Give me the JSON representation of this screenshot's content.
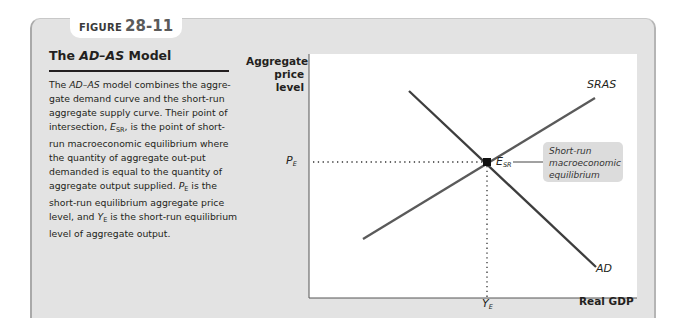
{
  "figure": {
    "label_word": "FIGURE",
    "label_number": "28-11"
  },
  "panel": {
    "title_prefix": "The ",
    "title_italic": "AD–AS",
    "title_suffix": " Model",
    "body": [
      {
        "t": "The "
      },
      {
        "t": "AD–AS",
        "i": true
      },
      {
        "t": " model combines the aggre-gate demand curve and the short-run aggregate supply curve. Their point of intersection, "
      },
      {
        "t": "E",
        "i": true
      },
      {
        "t": "SR",
        "sub": true
      },
      {
        "t": ", is the point of short-run macroeconomic equilibrium where the quantity of aggregate out-put demanded is equal to the quantity of aggregate output supplied. "
      },
      {
        "t": "P",
        "i": true
      },
      {
        "t": "E",
        "sub": true
      },
      {
        "t": " is the short-run equilibrium aggregate price level, and "
      },
      {
        "t": "Y",
        "i": true
      },
      {
        "t": "E",
        "sub": true
      },
      {
        "t": " is the short-run equilibrium level of aggregate output."
      }
    ]
  },
  "chart_data": {
    "type": "line",
    "title": "The AD–AS Model",
    "xlabel": "Real GDP",
    "ylabel": "Aggregate price level",
    "ylabel_lines": [
      "Aggregate",
      "price",
      "level"
    ],
    "grid": false,
    "series": [
      {
        "name": "AD",
        "description": "Aggregate demand, downward sloping",
        "points": [
          [
            0.31,
            0.84
          ],
          [
            0.88,
            0.13
          ]
        ]
      },
      {
        "name": "SRAS",
        "description": "Short-run aggregate supply, upward sloping",
        "points": [
          [
            0.17,
            0.24
          ],
          [
            0.88,
            0.81
          ]
        ]
      }
    ],
    "equilibrium": {
      "label": "E_SR",
      "x_label": "Y_E",
      "y_label": "P_E",
      "x": 0.54,
      "y": 0.56
    },
    "annotations": [
      {
        "text": "Short-run macroeconomic equilibrium",
        "target": "E_SR"
      },
      {
        "text": "SRAS",
        "target": "SRAS"
      },
      {
        "text": "AD",
        "target": "AD"
      }
    ],
    "ticks": {
      "x": [
        "Y_E"
      ],
      "y": [
        "P_E"
      ]
    }
  },
  "labels": {
    "pe_main": "P",
    "pe_sub": "E",
    "ye_main": "Y",
    "ye_sub": "E",
    "esr_main": "E",
    "esr_sub": "SR",
    "sras": "SRAS",
    "ad": "AD",
    "xlabel": "Real GDP",
    "ylabel_1": "Aggregate",
    "ylabel_2": "price",
    "ylabel_3": "level",
    "callout_1": "Short-run",
    "callout_2": "macroeconomic",
    "callout_3": "equilibrium"
  },
  "colors": {
    "panel_bg": "#e3e3e3",
    "curve": "#3d3d3d",
    "plot_bg": "#ffffff",
    "callout_bg": "#dcdcdc"
  }
}
